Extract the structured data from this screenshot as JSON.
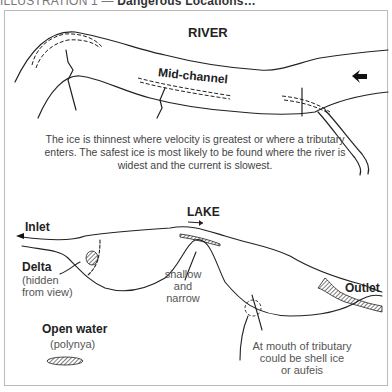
{
  "header": {
    "prefix": "ILLUSTRATION 1 — ",
    "title": "Dangerous Locations…"
  },
  "river": {
    "title": "RIVER",
    "mid_channel_label": "Mid-channel",
    "caption": "The ice is thinnest where velocity is greatest or where a tributary enters. The safest ice is most likely to be found where the river is widest and the current is slowest.",
    "flow_arrow": "arrow-left-icon"
  },
  "lake": {
    "title": "LAKE",
    "inlet_label": "Inlet",
    "delta_label": "Delta",
    "delta_note_1": "(hidden",
    "delta_note_2": "from view)",
    "shallow_1": "shallow",
    "shallow_2": "and",
    "shallow_3": "narrow",
    "outlet_label": "Outlet",
    "open_water_label": "Open water",
    "open_water_note": "(polynya)",
    "tributary_1": "At mouth of tributary",
    "tributary_2": "could be shell ice",
    "tributary_3": "or aufeis"
  },
  "colors": {
    "line": "#222222",
    "frame": "#bbbbbb",
    "text": "#333333"
  }
}
